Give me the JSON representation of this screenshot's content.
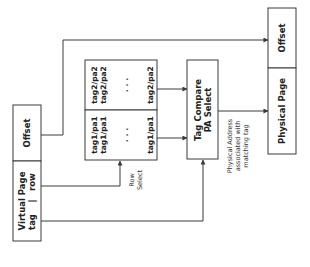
{
  "diagram": {
    "virtual_address": {
      "offset_label": "Offset",
      "page_label": "Virtual Page",
      "tag_label": "tag",
      "separator": "|",
      "row_label": "row"
    },
    "tag_array": {
      "column1": [
        "tag1/pa1",
        "tag1/pa1",
        "tag1/pa1"
      ],
      "column2": [
        "tag2/pa2",
        "tag2/pa2",
        "tag2/pa2"
      ],
      "ellipsis": ". . ."
    },
    "row_select_label_line1": "Row",
    "row_select_label_line2": "Select",
    "compare_box": {
      "line1": "Tag Compare",
      "line2": "PA Select"
    },
    "pa_note": {
      "line1": "Physical Address",
      "line2": "associated with",
      "line3": "matching tag"
    },
    "physical_address": {
      "offset_label": "Offset",
      "page_label": "Physical Page"
    }
  }
}
